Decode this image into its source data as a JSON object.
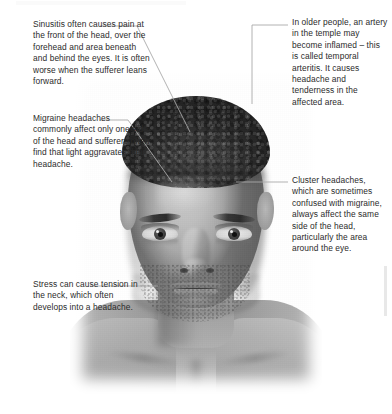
{
  "diagram": {
    "subject_alt": "Grayscale front-facing photograph of a man's head, neck and shoulders",
    "colors": {
      "background": "#ffffff",
      "text": "#2b2b2b",
      "leader_line": "#a9a9a9",
      "accent_bar": "#e8e8e8"
    },
    "annotations": [
      {
        "id": "sinusitis",
        "side": "left",
        "text": "Sinusitis often causes pain at the front of the head, over the forehead and area beneath and behind the eyes. It is often worse when the sufferer leans forward.",
        "points_to": "front of head / sinuses"
      },
      {
        "id": "migraine",
        "side": "left",
        "text": "Migraine headaches commonly affect only one side of the head and sufferers often find that light aggravates their headache.",
        "points_to": "one side of the head"
      },
      {
        "id": "stress",
        "side": "left",
        "text": "Stress can cause tension in the neck, which often develops into a headache.",
        "points_to": "neck"
      },
      {
        "id": "temporal-arteritis",
        "side": "right",
        "text": "In older people, an artery in the temple may become inflamed – this is called temporal arteritis. It causes headache and tenderness in the affected area.",
        "points_to": "temple artery"
      },
      {
        "id": "cluster",
        "side": "right",
        "text": "Cluster headaches, which are sometimes confused with migraine, always affect the same side of the head, particularly the area around the eye.",
        "points_to": "area around the eye"
      }
    ]
  }
}
